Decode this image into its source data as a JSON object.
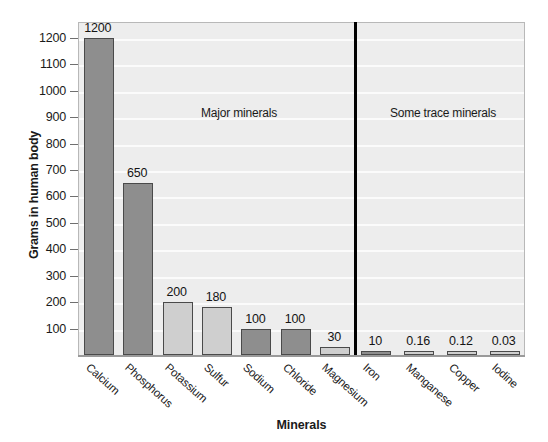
{
  "chart_data": {
    "type": "bar",
    "title": "",
    "xlabel": "Minerals",
    "ylabel": "Grams in human body",
    "ylim": [
      0,
      1260
    ],
    "grid": true,
    "legend": "none",
    "categories": [
      "Calcium",
      "Phosphorus",
      "Potassium",
      "Sulfur",
      "Sodium",
      "Chloride",
      "Magnesium",
      "Iron",
      "Manganese",
      "Copper",
      "Iodine"
    ],
    "values": [
      1200,
      650,
      200,
      180,
      100,
      100,
      30,
      10,
      0.16,
      0.12,
      0.03
    ],
    "value_labels": [
      "1200",
      "650",
      "200",
      "180",
      "100",
      "100",
      "30",
      "10",
      "0.16",
      "0.12",
      "0.03"
    ],
    "bar_shades": [
      "dark",
      "dark",
      "light",
      "light",
      "dark",
      "dark",
      "light",
      "dark",
      "light",
      "light",
      "light"
    ],
    "yticks": [
      100,
      200,
      300,
      400,
      500,
      600,
      700,
      800,
      900,
      1000,
      1100,
      1200
    ],
    "ytick_labels": [
      "100",
      "200",
      "300",
      "400",
      "500",
      "600",
      "700",
      "800",
      "900",
      "1000",
      "1100",
      "1200"
    ],
    "annotations": [
      {
        "text": "Major minerals",
        "x_px": 238,
        "y_px": 105
      },
      {
        "text": "Some trace minerals",
        "x_px": 442,
        "y_px": 105
      }
    ],
    "divider_x_px": 354,
    "colors": {
      "bar_dark": "#8e8e8e",
      "bar_light": "#cfcfcf",
      "bar_border": "#4a4a4a",
      "plot_background": "#ededed",
      "gridline": "#fbfbfb",
      "divider": "#000000",
      "text": "#1a1a1a"
    }
  }
}
